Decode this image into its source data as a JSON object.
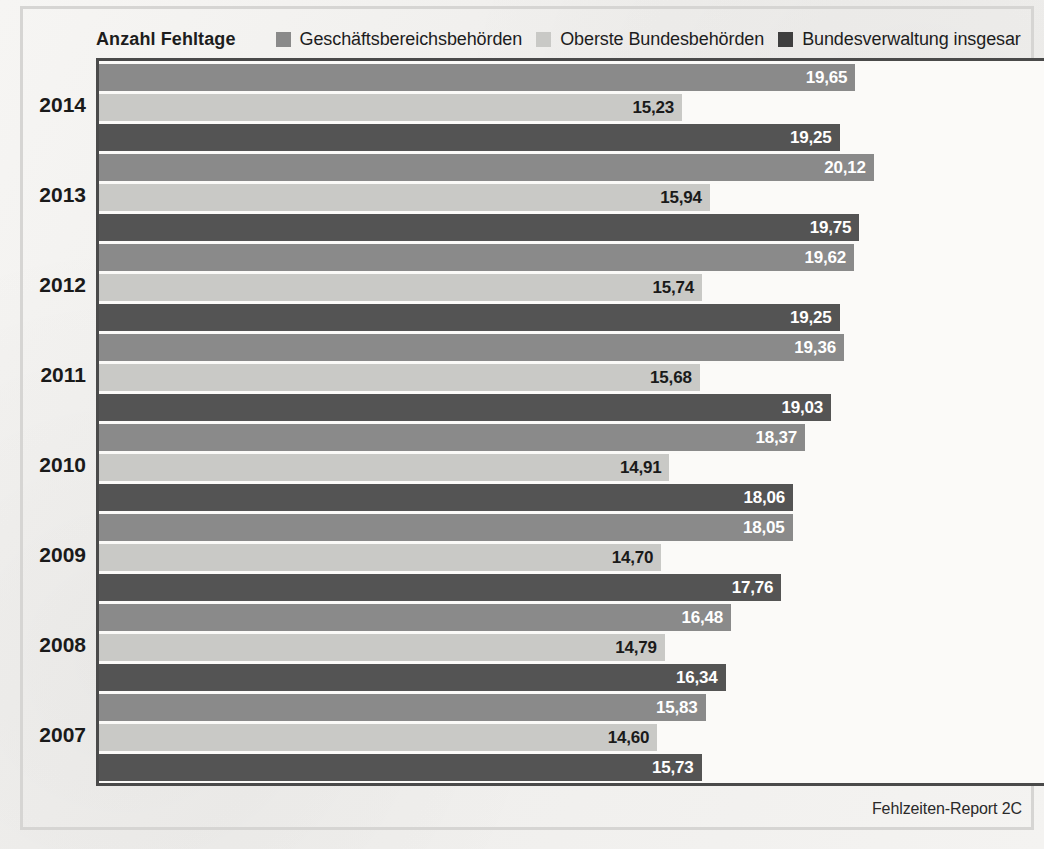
{
  "chart_data": {
    "type": "bar",
    "orientation": "horizontal",
    "title": "",
    "xlabel": "Anzahl Fehltage",
    "ylabel": "",
    "grid": false,
    "legend_position": "top",
    "value_format": "comma-decimal",
    "xlim": [
      0,
      21.5
    ],
    "categories": [
      "2014",
      "2013",
      "2012",
      "2011",
      "2010",
      "2009",
      "2008",
      "2007"
    ],
    "series": [
      {
        "name": "Geschäftsbereichsbehörden",
        "color": "#8a8a8a",
        "values": [
          19.65,
          20.12,
          19.62,
          19.36,
          18.37,
          18.05,
          16.48,
          15.83
        ],
        "labels": [
          "19,65",
          "20,12",
          "19,62",
          "19,36",
          "18,37",
          "18,05",
          "16,48",
          "15,83"
        ]
      },
      {
        "name": "Oberste Bundesbehörden",
        "color": "#c9c9c6",
        "values": [
          15.23,
          15.94,
          15.74,
          15.68,
          14.91,
          14.7,
          14.79,
          14.6
        ],
        "labels": [
          "15,23",
          "15,94",
          "15,74",
          "15,68",
          "14,91",
          "14,70",
          "14,79",
          "14,60"
        ]
      },
      {
        "name": "Bundesverwaltung insgesamt",
        "color": "#545454",
        "values": [
          19.25,
          19.75,
          19.25,
          19.03,
          18.06,
          17.76,
          16.34,
          15.73
        ],
        "labels": [
          "19,25",
          "19,75",
          "19,25",
          "19,03",
          "18,06",
          "17,76",
          "16,34",
          "15,73"
        ]
      }
    ]
  },
  "header": {
    "axis_title": "Anzahl Fehltage",
    "legend": [
      {
        "label": "Geschäftsbereichsbehörden",
        "color": "#8a8a8a"
      },
      {
        "label": "Oberste Bundesbehörden",
        "color": "#c9c9c6"
      },
      {
        "label": "Bundesverwaltung insgesar",
        "color": "#3f3f3f"
      }
    ]
  },
  "footer": {
    "source": "Fehlzeiten-Report 2C"
  },
  "bleed_text": [
    {
      "text": "eine Ab",
      "x": 872,
      "y": 508,
      "size": 19
    },
    {
      "text": "Bundesbeh",
      "x": 832,
      "y": 566,
      "size": 21
    },
    {
      "text": "en Sektor b",
      "x": 836,
      "y": 592,
      "size": 21
    },
    {
      "text": "Die Krank",
      "x": 846,
      "y": 640,
      "size": 19
    },
    {
      "text": "sondere Ent",
      "x": 842,
      "y": 700,
      "size": 18
    },
    {
      "text": "des Effe",
      "x": 866,
      "y": 726,
      "size": 18
    }
  ]
}
